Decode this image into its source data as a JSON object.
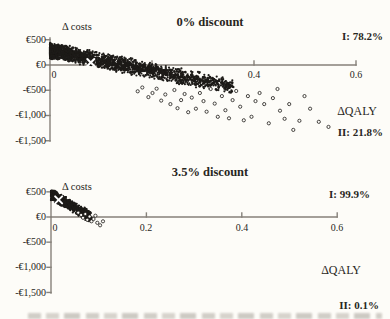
{
  "style": {
    "background": "#fdfcf8",
    "text_color": "#282622",
    "axis_color": "#86817a",
    "point_color": "#1d1b18",
    "open_point_fill": "#fdfcf8",
    "marker_color": "#ffffff"
  },
  "chart_data": [
    {
      "type": "scatter",
      "title": "0% discount",
      "ylabel": "Δ costs",
      "xlabel": "ΔQALY",
      "xlim": [
        0,
        0.6
      ],
      "ylim": [
        -1500,
        500
      ],
      "grid": "off",
      "x_ticks": [
        {
          "value": 0,
          "label": "0"
        },
        {
          "value": 0.2,
          "label": ""
        },
        {
          "value": 0.4,
          "label": "0.4"
        },
        {
          "value": 0.6,
          "label": "0.6"
        }
      ],
      "y_ticks": [
        {
          "value": 500,
          "label": "€500"
        },
        {
          "value": 0,
          "label": "€0"
        },
        {
          "value": -500,
          "label": "-€500"
        },
        {
          "value": -1000,
          "label": "-€1,000"
        },
        {
          "value": -1500,
          "label": "-€1,500"
        }
      ],
      "quadrants": [
        {
          "name": "I",
          "label": "I: 78.2%",
          "position": "top-right"
        },
        {
          "name": "II",
          "label": "II: 21.8%",
          "position": "bottom-right"
        }
      ],
      "mean_marker": {
        "x": 0.08,
        "y": 50,
        "symbol": "x"
      },
      "cloud_model": {
        "note": "dense Monte Carlo CE cloud, approximated distribution",
        "count": 2200,
        "seed": 7,
        "x_max": 0.36,
        "x_power": 1.8,
        "intercept": 290,
        "slope": -2000,
        "y_noise": 170,
        "y_clamp": [
          -1350,
          490
        ]
      },
      "outlier_points": [
        [
          0.172,
          -520
        ],
        [
          0.181,
          -445
        ],
        [
          0.193,
          -635
        ],
        [
          0.201,
          -555
        ],
        [
          0.209,
          -470
        ],
        [
          0.218,
          -705
        ],
        [
          0.226,
          -585
        ],
        [
          0.236,
          -775
        ],
        [
          0.244,
          -495
        ],
        [
          0.25,
          -855
        ],
        [
          0.257,
          -695
        ],
        [
          0.264,
          -575
        ],
        [
          0.271,
          -935
        ],
        [
          0.278,
          -645
        ],
        [
          0.286,
          -865
        ],
        [
          0.294,
          -555
        ],
        [
          0.301,
          -715
        ],
        [
          0.307,
          -925
        ],
        [
          0.315,
          -475
        ],
        [
          0.323,
          -765
        ],
        [
          0.329,
          -1025
        ],
        [
          0.337,
          -615
        ],
        [
          0.344,
          -895
        ],
        [
          0.351,
          -1055
        ],
        [
          0.358,
          -695
        ],
        [
          0.365,
          -515
        ],
        [
          0.373,
          -825
        ],
        [
          0.38,
          -1095
        ],
        [
          0.388,
          -615
        ],
        [
          0.395,
          -1025
        ],
        [
          0.403,
          -715
        ],
        [
          0.411,
          -555
        ],
        [
          0.42,
          -775
        ],
        [
          0.429,
          -1155
        ],
        [
          0.437,
          -655
        ],
        [
          0.446,
          -475
        ],
        [
          0.451,
          -905
        ],
        [
          0.46,
          -1065
        ],
        [
          0.469,
          -775
        ],
        [
          0.477,
          -1285
        ],
        [
          0.489,
          -1105
        ],
        [
          0.499,
          -615
        ],
        [
          0.51,
          -865
        ],
        [
          0.527,
          -1125
        ],
        [
          0.546,
          -1225
        ]
      ]
    },
    {
      "type": "scatter",
      "title": "3.5% discount",
      "ylabel": "Δ costs",
      "xlabel": "ΔQALY",
      "xlim": [
        0,
        0.6
      ],
      "ylim": [
        -1500,
        500
      ],
      "grid": "off",
      "x_ticks": [
        {
          "value": 0,
          "label": "0"
        },
        {
          "value": 0.2,
          "label": "0.2"
        },
        {
          "value": 0.4,
          "label": "0.4"
        },
        {
          "value": 0.6,
          "label": "0.6"
        }
      ],
      "y_ticks": [
        {
          "value": 500,
          "label": "€500"
        },
        {
          "value": 0,
          "label": "€0"
        },
        {
          "value": -500,
          "label": "-€500"
        },
        {
          "value": -1000,
          "label": "-€1,000"
        },
        {
          "value": -1500,
          "label": "-€1,500"
        }
      ],
      "quadrants": [
        {
          "name": "I",
          "label": "I: 99.9%",
          "position": "top-right"
        },
        {
          "name": "II",
          "label": "II: 0.1%",
          "position": "bottom-right"
        }
      ],
      "mean_marker": {
        "x": 0.016,
        "y": 340,
        "symbol": "x"
      },
      "cloud_model": {
        "note": "dense Monte Carlo CE cloud, approximated distribution",
        "count": 900,
        "seed": 11,
        "x_max": 0.085,
        "x_power": 1.35,
        "intercept": 450,
        "slope": -5400,
        "y_noise": 125,
        "y_clamp": [
          -110,
          520
        ]
      },
      "outlier_points": [
        [
          0.057,
          85
        ],
        [
          0.063,
          40
        ],
        [
          0.067,
          -15
        ],
        [
          0.072,
          60
        ],
        [
          0.076,
          -55
        ],
        [
          0.081,
          10
        ],
        [
          0.085,
          -85
        ],
        [
          0.089,
          -40
        ],
        [
          0.093,
          25
        ],
        [
          0.097,
          -115
        ],
        [
          0.103,
          -165
        ],
        [
          0.109,
          -85
        ]
      ]
    }
  ]
}
